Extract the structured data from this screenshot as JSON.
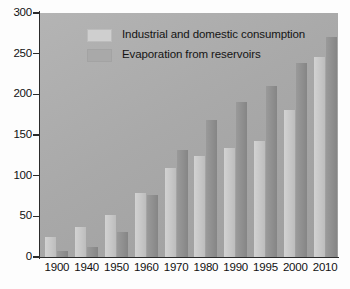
{
  "chart_data": {
    "type": "bar",
    "title": "",
    "subtitle": "",
    "xlabel": "",
    "ylabel": "",
    "categories": [
      "1900",
      "1940",
      "1950",
      "1960",
      "1970",
      "1980",
      "1990",
      "1995",
      "2000",
      "2010"
    ],
    "series": [
      {
        "name": "Industrial and domestic consumption",
        "color": "#c8c8c8",
        "values": [
          25,
          37,
          52,
          79,
          110,
          124,
          134,
          143,
          181,
          246
        ]
      },
      {
        "name": "Evaporation from reservoirs",
        "color": "#909090",
        "values": [
          8,
          12,
          31,
          76,
          132,
          168,
          191,
          210,
          238,
          270
        ]
      }
    ],
    "ylim": [
      0,
      300
    ],
    "yticks": [
      0,
      50,
      100,
      150,
      200,
      250,
      300
    ],
    "ytick_labels": [
      "0",
      "50",
      "100",
      "150",
      "200",
      "250",
      "300"
    ],
    "grid": false,
    "legend_position": "top-left",
    "plot_background_color": "#a9a9a9",
    "axis_color": "#2b2b2b",
    "figure_background_color": "#ffffff"
  },
  "legend": {
    "entries": [
      {
        "label": "Industrial and domestic consumption"
      },
      {
        "label": "Evaporation from reservoirs"
      }
    ]
  }
}
